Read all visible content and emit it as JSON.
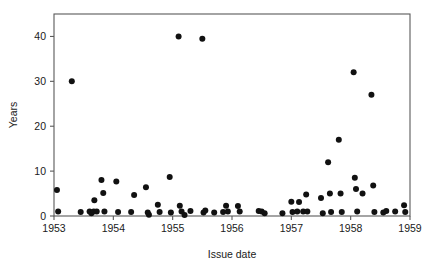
{
  "chart_data": {
    "type": "scatter",
    "title": "",
    "xlabel": "Issue date",
    "ylabel": "Years",
    "xlim": [
      1953,
      1959
    ],
    "ylim": [
      0,
      45
    ],
    "xticks": [
      1953,
      1954,
      1955,
      1956,
      1957,
      1958,
      1959
    ],
    "xticklabels": [
      "1953",
      "1954",
      "1955",
      "1956",
      "1957",
      "1958",
      "1959"
    ],
    "yticks": [
      0,
      10,
      20,
      30,
      40
    ],
    "yticklabels": [
      "0",
      "10",
      "20",
      "30",
      "40"
    ],
    "grid": false,
    "legend": null,
    "marker": "filled-circle",
    "marker_color": "#111111",
    "points": [
      {
        "x": 1953.05,
        "y": 5.8
      },
      {
        "x": 1953.07,
        "y": 1.0
      },
      {
        "x": 1953.3,
        "y": 30.0
      },
      {
        "x": 1953.45,
        "y": 0.9
      },
      {
        "x": 1953.6,
        "y": 1.0
      },
      {
        "x": 1953.63,
        "y": 0.6
      },
      {
        "x": 1953.67,
        "y": 1.0
      },
      {
        "x": 1953.68,
        "y": 3.5
      },
      {
        "x": 1953.72,
        "y": 1.0
      },
      {
        "x": 1953.8,
        "y": 8.0
      },
      {
        "x": 1953.83,
        "y": 5.1
      },
      {
        "x": 1953.85,
        "y": 1.0
      },
      {
        "x": 1954.05,
        "y": 7.7
      },
      {
        "x": 1954.08,
        "y": 0.9
      },
      {
        "x": 1954.3,
        "y": 0.9
      },
      {
        "x": 1954.35,
        "y": 4.7
      },
      {
        "x": 1954.55,
        "y": 6.4
      },
      {
        "x": 1954.58,
        "y": 0.8
      },
      {
        "x": 1954.6,
        "y": 0.3
      },
      {
        "x": 1954.75,
        "y": 2.5
      },
      {
        "x": 1954.78,
        "y": 0.9
      },
      {
        "x": 1954.95,
        "y": 8.7
      },
      {
        "x": 1954.97,
        "y": 0.8
      },
      {
        "x": 1955.1,
        "y": 40.0
      },
      {
        "x": 1955.12,
        "y": 2.3
      },
      {
        "x": 1955.15,
        "y": 1.0
      },
      {
        "x": 1955.2,
        "y": 0.2
      },
      {
        "x": 1955.3,
        "y": 1.1
      },
      {
        "x": 1955.5,
        "y": 39.5
      },
      {
        "x": 1955.52,
        "y": 0.8
      },
      {
        "x": 1955.55,
        "y": 1.2
      },
      {
        "x": 1955.7,
        "y": 0.8
      },
      {
        "x": 1955.85,
        "y": 0.9
      },
      {
        "x": 1955.9,
        "y": 2.3
      },
      {
        "x": 1955.93,
        "y": 1.0
      },
      {
        "x": 1956.1,
        "y": 2.2
      },
      {
        "x": 1956.13,
        "y": 1.0
      },
      {
        "x": 1956.45,
        "y": 1.1
      },
      {
        "x": 1956.5,
        "y": 1.0
      },
      {
        "x": 1956.55,
        "y": 0.6
      },
      {
        "x": 1956.85,
        "y": 0.6
      },
      {
        "x": 1957.0,
        "y": 3.2
      },
      {
        "x": 1957.02,
        "y": 0.9
      },
      {
        "x": 1957.1,
        "y": 1.0
      },
      {
        "x": 1957.13,
        "y": 3.1
      },
      {
        "x": 1957.2,
        "y": 1.0
      },
      {
        "x": 1957.25,
        "y": 4.8
      },
      {
        "x": 1957.27,
        "y": 1.0
      },
      {
        "x": 1957.5,
        "y": 4.0
      },
      {
        "x": 1957.53,
        "y": 0.6
      },
      {
        "x": 1957.62,
        "y": 12.0
      },
      {
        "x": 1957.65,
        "y": 5.0
      },
      {
        "x": 1957.67,
        "y": 0.9
      },
      {
        "x": 1957.8,
        "y": 17.0
      },
      {
        "x": 1957.83,
        "y": 5.0
      },
      {
        "x": 1957.85,
        "y": 0.9
      },
      {
        "x": 1958.05,
        "y": 32.0
      },
      {
        "x": 1958.07,
        "y": 8.5
      },
      {
        "x": 1958.09,
        "y": 6.0
      },
      {
        "x": 1958.11,
        "y": 1.0
      },
      {
        "x": 1958.2,
        "y": 5.0
      },
      {
        "x": 1958.35,
        "y": 27.0
      },
      {
        "x": 1958.38,
        "y": 6.8
      },
      {
        "x": 1958.4,
        "y": 0.9
      },
      {
        "x": 1958.55,
        "y": 0.8
      },
      {
        "x": 1958.6,
        "y": 1.1
      },
      {
        "x": 1958.75,
        "y": 1.0
      },
      {
        "x": 1958.9,
        "y": 2.4
      },
      {
        "x": 1958.92,
        "y": 0.9
      }
    ]
  },
  "axes": {
    "y_title": "Years",
    "x_title": "Issue date"
  }
}
